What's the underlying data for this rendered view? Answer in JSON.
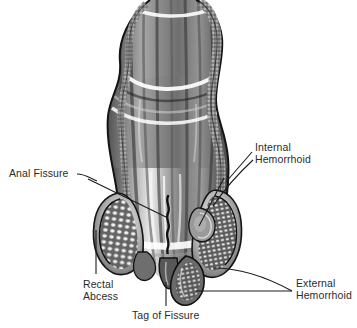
{
  "figure": {
    "style": "grayscale engraving / halftone medical illustration",
    "background_color": "#ffffff",
    "label_color": "#2b2b2b",
    "leader_line_color": "#1c1c1c",
    "ink_dark": "#1a1a1a",
    "ink_mid": "#7d7d7d",
    "ink_light": "#d8d8d8",
    "highlight": "#ffffff"
  },
  "labels": [
    {
      "id": "anal-fissure",
      "text": "Anal Fissure",
      "lines": [
        "Anal Fissure"
      ],
      "position": "left-middle",
      "points_to": "vertical fissure in anal canal mucosa"
    },
    {
      "id": "internal-hemorrhoid",
      "text": "Internal Hemorrhoid",
      "lines": [
        "Internal",
        "Hemorrhoid"
      ],
      "position": "right-middle",
      "points_to": "swollen vascular cushion above dentate line"
    },
    {
      "id": "external-hemorrhoid",
      "text": "External Hemorrhoid",
      "lines": [
        "External",
        "Hemorrhoid"
      ],
      "position": "right-bottom",
      "points_to": "pendulous lobe below anal verge"
    },
    {
      "id": "rectal-abcess",
      "text": "Rectal Abcess",
      "lines": [
        "Rectal",
        "Abcess"
      ],
      "position": "left-bottom",
      "points_to": "left sphincter muscle region"
    },
    {
      "id": "tag-of-fissure",
      "text": "Tag of Fissure",
      "lines": [
        "Tag of Fissure"
      ],
      "position": "bottom-center",
      "points_to": "small sentinel skin tag at anal verge"
    }
  ]
}
